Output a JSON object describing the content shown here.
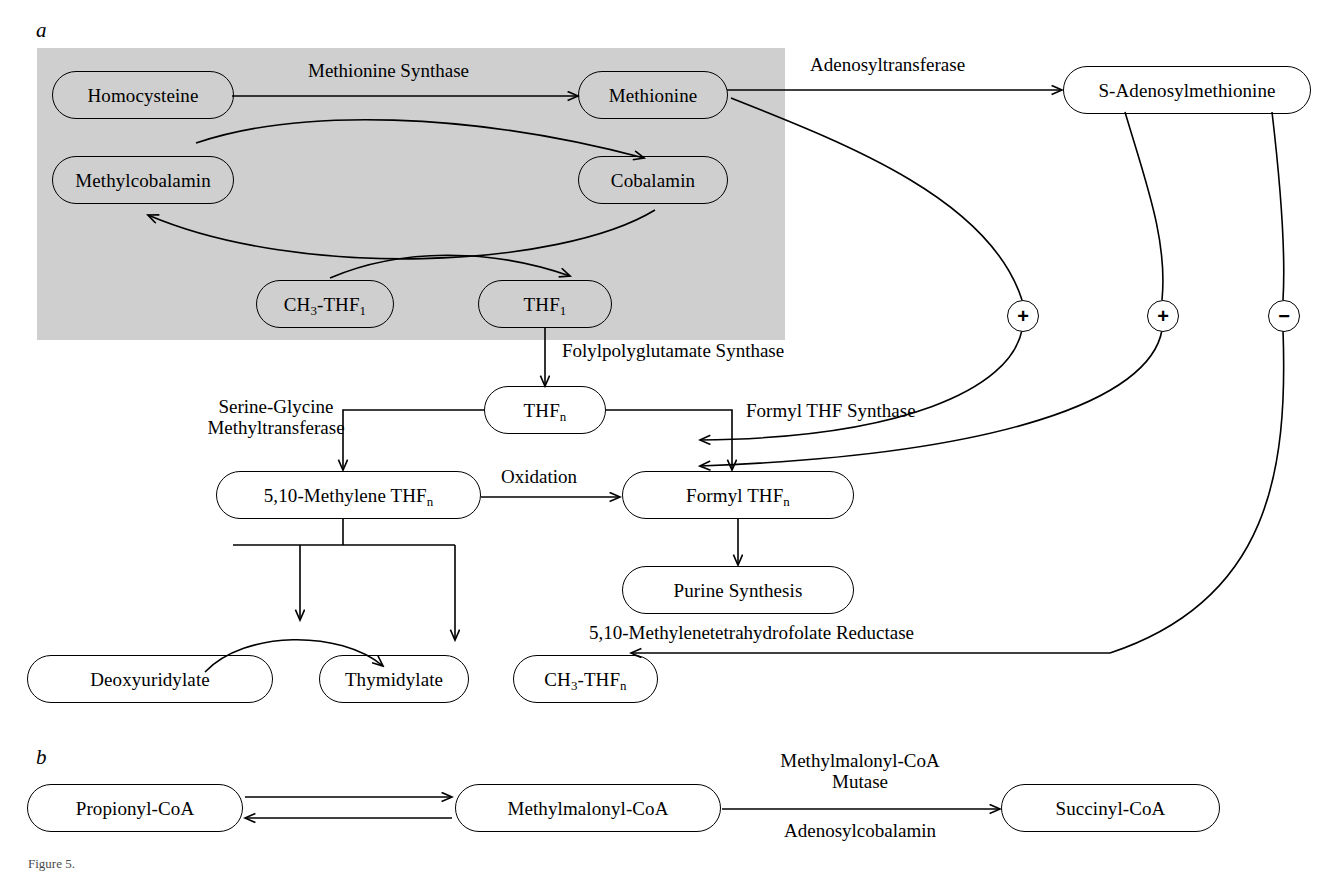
{
  "figure": {
    "panel_a_letter": "a",
    "panel_b_letter": "b",
    "caption": "Figure 5."
  },
  "colors": {
    "shade": "#cfcfcf",
    "stroke": "#000000",
    "background": "#ffffff"
  },
  "panel_a": {
    "nodes": {
      "homocysteine": "Homocysteine",
      "methionine": "Methionine",
      "s_adenosylmethionine": "S-Adenosylmethionine",
      "methylcobalamin": "Methylcobalamin",
      "cobalamin": "Cobalamin",
      "ch3_thf1": "CH3-THF1",
      "thf1": "THF1",
      "thfn": "THFn",
      "methylene_thfn": "5,10-Methylene THFn",
      "formyl_thfn": "Formyl THFn",
      "purine_synthesis": "Purine Synthesis",
      "deoxyuridylate": "Deoxyuridylate",
      "thymidylate": "Thymidylate",
      "ch3_thfn": "CH3-THFn"
    },
    "enzymes": {
      "methionine_synthase": "Methionine Synthase",
      "adenosyltransferase": "Adenosyltransferase",
      "folylpolyglutamate_synthase": "Folylpolyglutamate Synthase",
      "serine_glycine_methyltransferase_line1": "Serine-Glycine",
      "serine_glycine_methyltransferase_line2": "Methyltransferase",
      "oxidation": "Oxidation",
      "formyl_thf_synthase": "Formyl THF Synthase",
      "methylenetetrahydrofolate_reductase": "5,10-Methylenetetrahydrofolate Reductase"
    },
    "signs": {
      "sign_1": "+",
      "sign_2": "+",
      "sign_3": "−"
    }
  },
  "panel_b": {
    "nodes": {
      "propionyl_coa": "Propionyl-CoA",
      "methylmalonyl_coa": "Methylmalonyl-CoA",
      "succinyl_coa": "Succinyl-CoA"
    },
    "enzymes": {
      "mutase_line1": "Methylmalonyl-CoA",
      "mutase_line2": "Mutase",
      "cofactor": "Adenosylcobalamin"
    }
  }
}
